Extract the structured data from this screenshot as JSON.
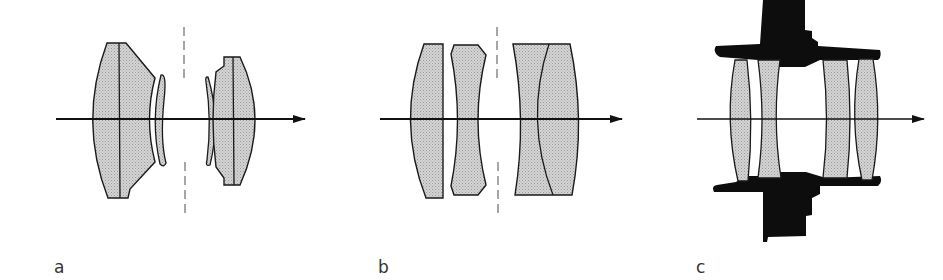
{
  "figure": {
    "panels": [
      {
        "id": "a",
        "label": "a",
        "description": "Symmetrical lens design with two thick meniscus groups and thin menisci around a central aperture stop"
      },
      {
        "id": "b",
        "label": "b",
        "description": "Four-element lens: plano-convex, biconcave, and cemented doublet around aperture stop"
      },
      {
        "id": "c",
        "label": "c",
        "description": "Lens cross-section in barrel mount: four elements held in black mount"
      }
    ],
    "elements": {
      "optical_axis": "arrow",
      "aperture_stop": "dashed line"
    }
  },
  "colors": {
    "glass_fill": "#c8c8c8",
    "outline": "#1a1a1a",
    "mount": "#0d0d0d",
    "background": "#ffffff",
    "stop_dash": "#777777"
  }
}
